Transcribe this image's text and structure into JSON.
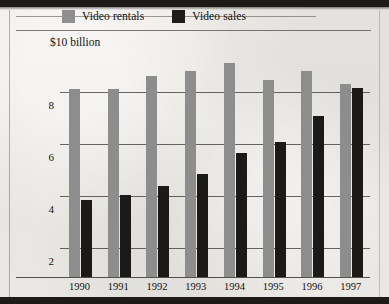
{
  "chart_data": {
    "type": "bar",
    "title": "",
    "subtitle": "",
    "xlabel": "",
    "ylabel": "",
    "unit_label": "$10 billion",
    "categories": [
      "1990",
      "1991",
      "1992",
      "1993",
      "1994",
      "1995",
      "1996",
      "1997"
    ],
    "series": [
      {
        "name": "Video rentals",
        "color": "#8d8d8d",
        "values": [
          8.1,
          8.1,
          8.6,
          8.8,
          9.1,
          8.45,
          8.8,
          8.3
        ]
      },
      {
        "name": "Video sales",
        "color": "#1c1a19",
        "values": [
          3.85,
          4.05,
          4.4,
          4.85,
          5.65,
          6.1,
          7.1,
          8.15
        ]
      }
    ],
    "ylim": [
      0.9,
      10
    ],
    "yticks": [
      2,
      4,
      6,
      8
    ],
    "ytick_labels": [
      "2",
      "4",
      "6",
      "8"
    ],
    "grid": true,
    "legend_position": "top"
  },
  "legend": {
    "items": [
      {
        "label": "Video rentals",
        "swatch": "light-gray-swatch"
      },
      {
        "label": "Video sales",
        "swatch": "dark-swatch"
      }
    ]
  },
  "axis": {
    "top_label": "$10 billion"
  }
}
